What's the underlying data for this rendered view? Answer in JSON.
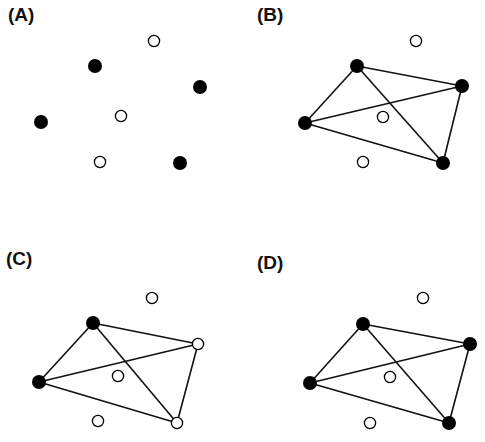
{
  "figure": {
    "panels": [
      {
        "label": "(A)",
        "label_pos": [
          8,
          5
        ],
        "filled": [
          [
            95,
            66
          ],
          [
            200,
            87
          ],
          [
            41,
            122
          ],
          [
            180,
            163
          ]
        ],
        "open": [
          [
            154,
            41
          ],
          [
            121,
            116
          ],
          [
            100,
            162
          ]
        ],
        "edges": []
      },
      {
        "label": "(B)",
        "label_pos": [
          257,
          5
        ],
        "filled": [
          [
            357,
            66
          ],
          [
            462,
            86
          ],
          [
            305,
            123
          ],
          [
            443,
            163
          ]
        ],
        "open": [
          [
            416,
            41
          ],
          [
            383,
            117
          ],
          [
            363,
            162
          ]
        ],
        "edges": [
          [
            [
              305,
              123
            ],
            [
              357,
              66
            ]
          ],
          [
            [
              357,
              66
            ],
            [
              462,
              86
            ]
          ],
          [
            [
              305,
              123
            ],
            [
              462,
              86
            ]
          ],
          [
            [
              305,
              123
            ],
            [
              443,
              163
            ]
          ],
          [
            [
              357,
              66
            ],
            [
              443,
              163
            ]
          ],
          [
            [
              462,
              86
            ],
            [
              443,
              163
            ]
          ]
        ]
      },
      {
        "label": "(C)",
        "label_pos": [
          6,
          249
        ],
        "filled": [
          [
            93,
            323
          ],
          [
            39,
            382
          ]
        ],
        "open": [
          [
            152,
            298
          ],
          [
            118,
            376
          ],
          [
            198,
            344
          ],
          [
            98,
            421
          ],
          [
            177,
            423
          ]
        ],
        "edges": [
          [
            [
              39,
              382
            ],
            [
              93,
              323
            ]
          ],
          [
            [
              93,
              323
            ],
            [
              198,
              344
            ]
          ],
          [
            [
              39,
              382
            ],
            [
              198,
              344
            ]
          ],
          [
            [
              39,
              382
            ],
            [
              177,
              423
            ]
          ],
          [
            [
              93,
              323
            ],
            [
              177,
              423
            ]
          ],
          [
            [
              198,
              344
            ],
            [
              177,
              423
            ]
          ]
        ]
      },
      {
        "label": "(D)",
        "label_pos": [
          257,
          253
        ],
        "filled": [
          [
            363,
            324
          ],
          [
            470,
            344
          ],
          [
            310,
            383
          ],
          [
            449,
            423
          ]
        ],
        "open": [
          [
            423,
            298
          ],
          [
            390,
            377
          ],
          [
            370,
            423
          ]
        ],
        "edges": [
          [
            [
              310,
              383
            ],
            [
              363,
              324
            ]
          ],
          [
            [
              363,
              324
            ],
            [
              470,
              344
            ]
          ],
          [
            [
              310,
              383
            ],
            [
              470,
              344
            ]
          ],
          [
            [
              310,
              383
            ],
            [
              449,
              423
            ]
          ],
          [
            [
              363,
              324
            ],
            [
              449,
              423
            ]
          ],
          [
            [
              470,
              344
            ],
            [
              449,
              423
            ]
          ]
        ]
      }
    ],
    "style": {
      "filled_color": "#000000",
      "open_stroke": "#000000",
      "open_fill": "#ffffff",
      "edge_color": "#111111"
    }
  }
}
